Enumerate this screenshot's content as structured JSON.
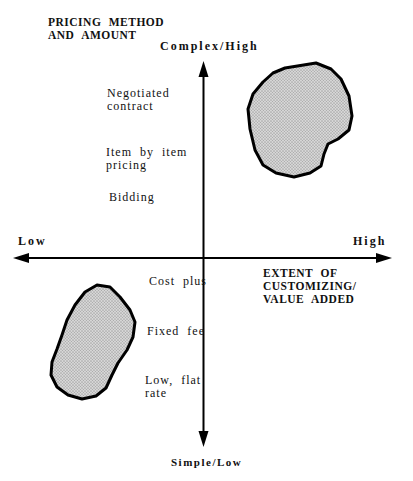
{
  "exhibit": {
    "label": "EXHIBIT 5.4"
  },
  "diagram": {
    "type": "quadrant-diagram",
    "y_axis": {
      "title": "PRICING METHOD\nAND AMOUNT",
      "top_label": "Complex/High",
      "bottom_label": "Simple/Low",
      "levels_above_origin": [
        "Negotiated\ncontract",
        "Item by item\npricing",
        "Bidding"
      ],
      "levels_below_origin": [
        "Cost plus",
        "Fixed fee",
        "Low, flat\nrate"
      ]
    },
    "x_axis": {
      "title": "EXTENT OF CUSTOMIZING/\nVALUE ADDED",
      "left_label": "Low",
      "right_label": "High"
    },
    "clusters": [
      {
        "name": "upper-right-cluster",
        "quadrant": "upper-right",
        "meaning": "high customizing / complex-high pricing"
      },
      {
        "name": "lower-left-cluster",
        "quadrant": "lower-left",
        "meaning": "low customizing / simple-low pricing"
      }
    ],
    "colors": {
      "background": "#ffffff",
      "ink": "#000000",
      "blob_fill_base": "#d6d6d6",
      "blob_fill_dot": "#a9a9a9",
      "blob_outline": "#000000"
    }
  }
}
